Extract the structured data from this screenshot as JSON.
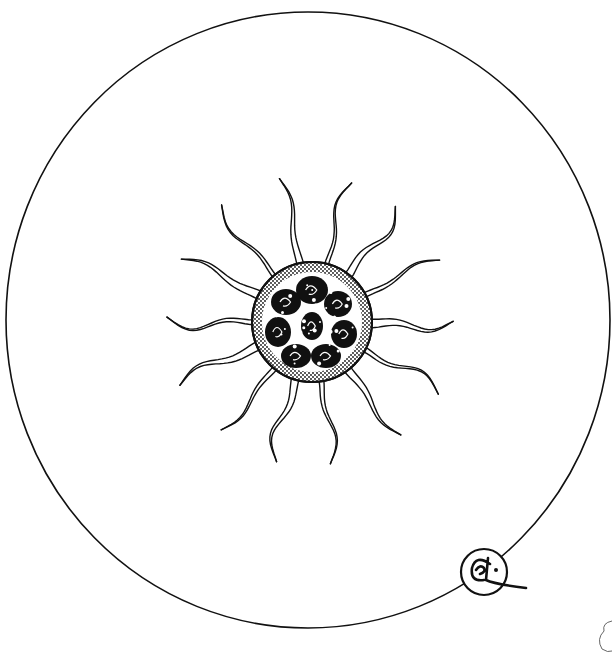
{
  "illustration": {
    "subject": "Radiolarian / sun-animalcule (heliozoan) pen illustration",
    "style": "black ink line drawing on white",
    "colors": {
      "ink": "#111111",
      "paper": "#ffffff"
    },
    "frame": {
      "shape": "circle",
      "cx": 308,
      "cy": 320,
      "rx": 302,
      "ry": 308
    },
    "body": {
      "cx": 312,
      "cy": 322,
      "r": 60,
      "texture": "stippled rim with dark lobed inclusions"
    },
    "rays": [
      {
        "tip": [
          283,
          178
        ],
        "width": 7
      },
      {
        "tip": [
          347,
          182
        ],
        "width": 4
      },
      {
        "tip": [
          400,
          210
        ],
        "width": 8
      },
      {
        "tip": [
          438,
          257
        ],
        "width": 5
      },
      {
        "tip": [
          453,
          326
        ],
        "width": 9
      },
      {
        "tip": [
          441,
          389
        ],
        "width": 5
      },
      {
        "tip": [
          398,
          437
        ],
        "width": 8
      },
      {
        "tip": [
          335,
          463
        ],
        "width": 5
      },
      {
        "tip": [
          271,
          460
        ],
        "width": 8
      },
      {
        "tip": [
          224,
          432
        ],
        "width": 5
      },
      {
        "tip": [
          178,
          381
        ],
        "width": 9
      },
      {
        "tip": [
          167,
          323
        ],
        "width": 5
      },
      {
        "tip": [
          183,
          256
        ],
        "width": 9
      },
      {
        "tip": [
          218,
          208
        ],
        "width": 4
      }
    ],
    "signature": {
      "text": "CL",
      "cx": 484,
      "cy": 572,
      "r": 23
    },
    "corner_mark": {
      "cx": 604,
      "cy": 635
    }
  }
}
